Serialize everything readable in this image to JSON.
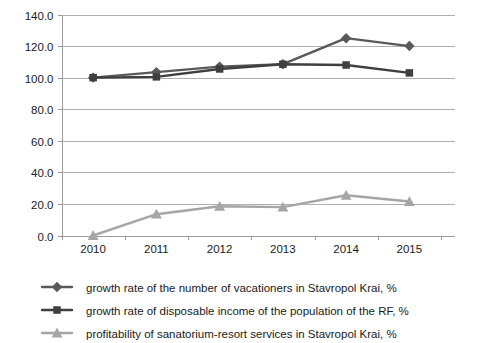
{
  "chart_data": {
    "type": "line",
    "title": "",
    "subtitle": "",
    "xlabel": "",
    "ylabel": "",
    "categories": [
      "2010",
      "2011",
      "2012",
      "2013",
      "2014",
      "2015"
    ],
    "x": [
      2010,
      2011,
      2012,
      2013,
      2014,
      2015
    ],
    "ylim": [
      0.0,
      140.0
    ],
    "ytick_step": 20.0,
    "yticks": [
      "0.0",
      "20.0",
      "40.0",
      "60.0",
      "80.0",
      "100.0",
      "120.0",
      "140.0"
    ],
    "ytick_values": [
      0.0,
      20.0,
      40.0,
      60.0,
      80.0,
      100.0,
      120.0,
      140.0
    ],
    "grid": true,
    "legend_position": "bottom",
    "series": [
      {
        "name": "growth rate of the number of vacationers in Stavropol Krai, %",
        "marker": "diamond",
        "color": "#595959",
        "values": [
          100.0,
          103.5,
          107.0,
          108.5,
          125.0,
          120.0
        ]
      },
      {
        "name": "growth rate of disposable income of the population of the RF, %",
        "marker": "square",
        "color": "#3f3f3f",
        "values": [
          100.0,
          100.5,
          105.5,
          108.5,
          108.0,
          103.0
        ]
      },
      {
        "name": "profitability of sanatorium-resort services in Stavropol Krai, %",
        "marker": "triangle",
        "color": "#a6a6a6",
        "values": [
          0.0,
          13.5,
          18.5,
          18.0,
          25.5,
          21.5
        ]
      }
    ]
  },
  "legend": {
    "entries": [
      {
        "label": "growth rate of the number of vacationers in Stavropol Krai, %",
        "marker": "diamond",
        "color": "#595959"
      },
      {
        "label": "growth rate of disposable income of the population of the RF, %",
        "marker": "square",
        "color": "#3f3f3f"
      },
      {
        "label": "profitability of sanatorium-resort services in Stavropol Krai, %",
        "marker": "triangle",
        "color": "#a6a6a6"
      }
    ]
  }
}
